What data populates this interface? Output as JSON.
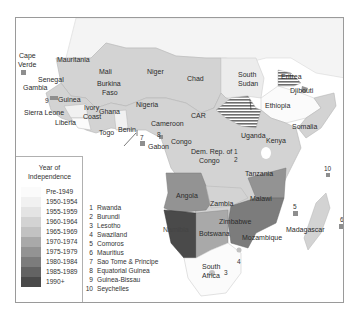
{
  "legend": {
    "title_line1": "Year of",
    "title_line2": "Independence",
    "items": [
      {
        "label": "Pre-1949",
        "color": "#fbfbfb"
      },
      {
        "label": "1950-1954",
        "color": "#f1f1f1"
      },
      {
        "label": "1955-1959",
        "color": "#e4e4e4"
      },
      {
        "label": "1960-1964",
        "color": "#d3d3d3"
      },
      {
        "label": "1965-1969",
        "color": "#c2c2c2"
      },
      {
        "label": "1970-1974",
        "color": "#a9a9a9"
      },
      {
        "label": "1975-1979",
        "color": "#939393"
      },
      {
        "label": "1980-1984",
        "color": "#7c7c7c"
      },
      {
        "label": "1985-1989",
        "color": "#636363"
      },
      {
        "label": "1990+",
        "color": "#4a4a4a"
      }
    ]
  },
  "key_list": [
    {
      "n": "1",
      "name": "Rwanda"
    },
    {
      "n": "2",
      "name": "Burundi"
    },
    {
      "n": "3",
      "name": "Lesotho"
    },
    {
      "n": "4",
      "name": "Swaziland"
    },
    {
      "n": "5",
      "name": "Comoros"
    },
    {
      "n": "6",
      "name": "Mauritius"
    },
    {
      "n": "7",
      "name": "Sao Tome & Principe"
    },
    {
      "n": "8",
      "name": "Equatorial Guinea"
    },
    {
      "n": "9",
      "name": "Guinea-Bissau"
    },
    {
      "n": "10",
      "name": "Seychelles"
    }
  ],
  "countries": {
    "cape_verde_1": "Cape",
    "cape_verde_2": "Verde",
    "mauritania": "Mauritania",
    "mali": "Mali",
    "niger": "Niger",
    "chad": "Chad",
    "senegal": "Senegal",
    "gambia": "Gambia",
    "guinea": "Guinea",
    "sierra_leone": "Sierra Leone",
    "liberia": "Liberia",
    "burkina_1": "Burkina",
    "burkina_2": "Faso",
    "ivory_1": "Ivory",
    "ivory_2": "Coast",
    "ghana": "Ghana",
    "togo": "Togo",
    "benin": "Benin",
    "nigeria": "Nigeria",
    "cameroon": "Cameroon",
    "car": "CAR",
    "gabon": "Gabon",
    "congo": "Congo",
    "drc_1": "Dem. Rep. of",
    "drc_2": "Congo",
    "south_sudan_1": "South",
    "south_sudan_2": "Sudan",
    "eritrea": "Eritrea",
    "djibouti": "Djibouti",
    "ethiopia": "Ethiopia",
    "somalia": "Somalia",
    "uganda": "Uganda",
    "kenya": "Kenya",
    "tanzania": "Tanzania",
    "angola": "Angola",
    "zambia": "Zambia",
    "malawi": "Malawi",
    "zimbabwe": "Zimbabwe",
    "namibia": "Namibia",
    "botswana": "Botswana",
    "mozambique": "Mozambique",
    "madagascar": "Madagascar",
    "south_africa_1": "South",
    "south_africa_2": "Africa"
  },
  "map_numbers": {
    "n1": "1",
    "n2": "2",
    "n3": "3",
    "n4": "4",
    "n5": "5",
    "n6": "6",
    "n7": "7",
    "n8": "8",
    "n9": "9",
    "n10": "10"
  }
}
